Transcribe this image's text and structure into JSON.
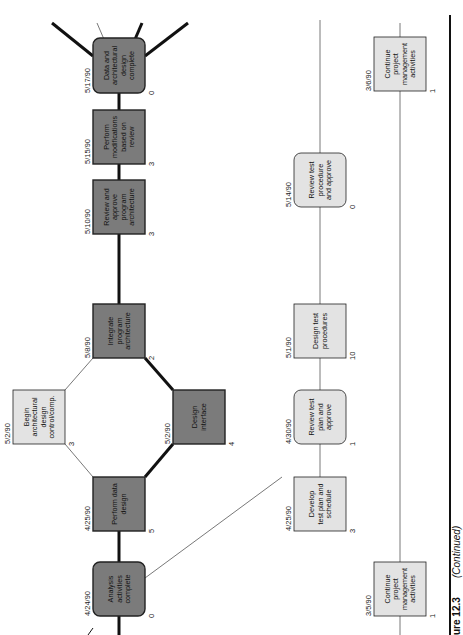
{
  "diagram": {
    "orientation": "rotated 90° counter-clockwise (text reads bottom-to-top)",
    "colors": {
      "critical_fill": "#7b7b7b",
      "normal_fill": "#e3e3e3",
      "border": "#222222",
      "edge": "#111111",
      "thin_edge": "#555555"
    },
    "nodes": [
      {
        "id": "data-arch-complete",
        "lines": [
          "Data and",
          "architectural",
          "design",
          "complete"
        ],
        "date": "5/17/90",
        "duration": "0",
        "style": "critical",
        "shape": "rounded"
      },
      {
        "id": "perform-modifications",
        "lines": [
          "Perform",
          "modifications",
          "based on",
          "review"
        ],
        "date": "5/15/90",
        "duration": "3",
        "style": "critical",
        "shape": "rect"
      },
      {
        "id": "review-approve-arch",
        "lines": [
          "Review and",
          "approve",
          "program",
          "architecture"
        ],
        "date": "5/10/90",
        "duration": "3",
        "style": "critical",
        "shape": "rect"
      },
      {
        "id": "integrate-arch",
        "lines": [
          "Integrate",
          "program",
          "architecture"
        ],
        "date": "5/8/90",
        "duration": "2",
        "style": "critical",
        "shape": "rect"
      },
      {
        "id": "begin-arch-control",
        "lines": [
          "Begin",
          "architectural",
          "design",
          "control/comp."
        ],
        "date": "5/2/90",
        "duration": "3",
        "style": "normal",
        "shape": "rect"
      },
      {
        "id": "design-interface",
        "lines": [
          "Design",
          "interface"
        ],
        "date": "5/2/90",
        "duration": "4",
        "style": "critical",
        "shape": "rect"
      },
      {
        "id": "perform-data-design",
        "lines": [
          "Perform data",
          "design"
        ],
        "date": "4/25/90",
        "duration": "5",
        "style": "critical",
        "shape": "rect"
      },
      {
        "id": "analysis-complete",
        "lines": [
          "Analysis",
          "activities",
          "complete"
        ],
        "date": "4/24/90",
        "duration": "0",
        "style": "critical",
        "shape": "rounded"
      },
      {
        "id": "review-test-procedure",
        "lines": [
          "Review test",
          "procedure",
          "and approve"
        ],
        "date": "5/14/90",
        "duration": "0",
        "style": "normal",
        "shape": "rounded"
      },
      {
        "id": "design-test-procedures",
        "lines": [
          "Design test",
          "procedures"
        ],
        "date": "5/1/90",
        "duration": "10",
        "style": "normal",
        "shape": "rect"
      },
      {
        "id": "review-test-plan",
        "lines": [
          "Review test",
          "plan and",
          "approve"
        ],
        "date": "4/30/90",
        "duration": "1",
        "style": "normal",
        "shape": "rounded"
      },
      {
        "id": "develop-test-plan",
        "lines": [
          "Develop",
          "test plan and",
          "schedule"
        ],
        "date": "4/25/90",
        "duration": "3",
        "style": "normal",
        "shape": "rect"
      },
      {
        "id": "continue-pm-top",
        "lines": [
          "Continue",
          "project",
          "management",
          "activities"
        ],
        "date": "3/6/90",
        "duration": "1",
        "style": "normal",
        "shape": "rect"
      },
      {
        "id": "continue-pm-bottom",
        "lines": [
          "Continue",
          "project",
          "management",
          "activities"
        ],
        "date": "3/5/90",
        "duration": "1",
        "style": "normal",
        "shape": "rect"
      }
    ],
    "caption": {
      "figure": "ure 12.3",
      "note": "(Continued)"
    }
  }
}
